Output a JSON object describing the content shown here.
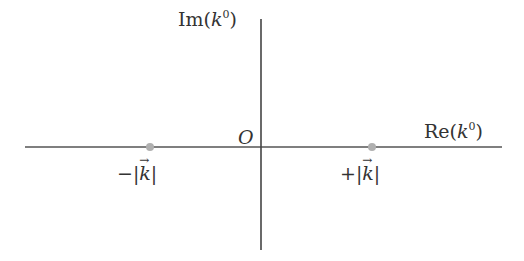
{
  "diagram": {
    "type": "complex-plane",
    "axes": {
      "horizontal": {
        "label_prefix": "Re",
        "label_var": "k",
        "label_sup": "0",
        "x1": 25,
        "x2": 502,
        "y": 147
      },
      "vertical": {
        "label_prefix": "Im",
        "label_var": "k",
        "label_sup": "0",
        "x": 261,
        "y1": 19,
        "y2": 250
      }
    },
    "origin": {
      "label": "O"
    },
    "points": [
      {
        "sign": "−",
        "var": "k",
        "x": 150,
        "y": 147
      },
      {
        "sign": "+",
        "var": "k",
        "x": 372,
        "y": 147
      }
    ],
    "colors": {
      "axis": "#444444",
      "point": "#aaaaaa",
      "text": "#333333"
    }
  }
}
